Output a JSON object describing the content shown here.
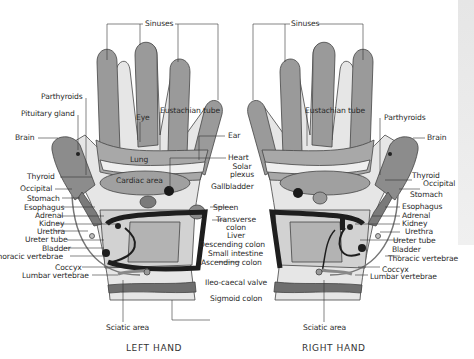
{
  "left_hand": {
    "title": "LEFT HAND",
    "labels": {
      "sinuses": "Sinuses",
      "parthyroids": "Parthyroids",
      "pituitary": "Pituitary gland",
      "brain": "Brain",
      "eye": "Eye",
      "eustachian": "Eustachian tube",
      "ear": "Ear",
      "lung": "Lung",
      "heart": "Heart",
      "cardiac": "Cardiac area",
      "solar1": "Solar",
      "solar2": "plexus",
      "gallbladder": "Gallbladder",
      "thyroid": "Thyroid",
      "occipital": "Occipital",
      "stomach": "Stomach",
      "esophagus": "Esophagus",
      "adrenal": "Adrenal",
      "kidney": "Kidney",
      "urethra": "Urethra",
      "ureter": "Ureter tube",
      "bladder": "Bladder",
      "thoracic": "Thoracic vertebrae",
      "coccyx": "Coccyx",
      "lumbar": "Lumbar vertebrae",
      "spleen": "Spleen",
      "transverse1": "Transverse",
      "transverse2": "colon",
      "liver": "Liver",
      "descending": "Descending colon",
      "small_intestine": "Small intestine",
      "ascending": "Ascending colon",
      "ileo": "Ileo-caecal valve",
      "sigmoid": "Sigmoid colon",
      "sciatic": "Sciatic area"
    }
  },
  "right_hand": {
    "title": "RIGHT HAND",
    "labels": {
      "sinuses": "Sinuses",
      "eustachian": "Eustachian tube",
      "parthyroids": "Parthyroids",
      "brain": "Brain",
      "thyroid": "Thyroid",
      "occipital": "Occipital",
      "stomach": "Stomach",
      "esophagus": "Esophagus",
      "adrenal": "Adrenal",
      "kidney": "Kidney",
      "urethra": "Urethra",
      "ureter": "Ureter tube",
      "bladder": "Bladder",
      "thoracic": "Thoracic vertebrae",
      "coccyx": "Coccyx",
      "lumbar": "Lumbar vertebrae",
      "sciatic": "Sciatic area"
    }
  },
  "colors": {
    "finger": "#9a9a9a",
    "palm_light": "#e4e4e4",
    "palm_mid": "#c9c9c9",
    "organ_dark": "#8c8c8c",
    "colon": "#1e1e1e",
    "band": "#6e6e6e",
    "outline": "#444444"
  }
}
